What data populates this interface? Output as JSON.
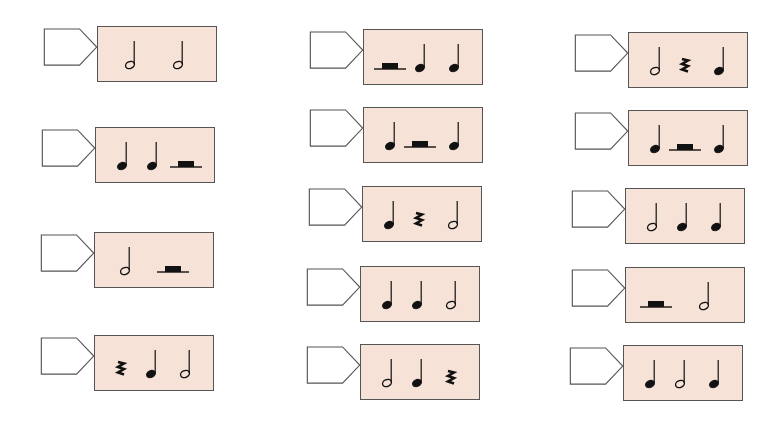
{
  "worksheet": {
    "colors": {
      "box_fill": "#f7e2d8",
      "box_border": "#555555",
      "tag_fill": "#ffffff",
      "tag_border": "#555555",
      "ink": "#111111"
    },
    "legend": {
      "half": "half-note",
      "quarter": "quarter-note",
      "quarter_rest": "quarter-rest",
      "half_rest": "half-rest"
    },
    "columns": [
      {
        "measures": [
          {
            "id": "c1-r1",
            "answer": "",
            "symbols": [
              "half",
              "half"
            ]
          },
          {
            "id": "c1-r2",
            "answer": "",
            "symbols": [
              "quarter",
              "quarter",
              "half_rest"
            ]
          },
          {
            "id": "c1-r3",
            "answer": "",
            "symbols": [
              "half",
              "half_rest"
            ]
          },
          {
            "id": "c1-r4",
            "answer": "",
            "symbols": [
              "quarter_rest",
              "quarter",
              "half"
            ]
          }
        ]
      },
      {
        "measures": [
          {
            "id": "c2-r1",
            "answer": "",
            "symbols": [
              "half_rest",
              "quarter",
              "quarter"
            ]
          },
          {
            "id": "c2-r2",
            "answer": "",
            "symbols": [
              "quarter",
              "half_rest",
              "quarter"
            ]
          },
          {
            "id": "c2-r3",
            "answer": "",
            "symbols": [
              "quarter",
              "quarter_rest",
              "half"
            ]
          },
          {
            "id": "c2-r4",
            "answer": "",
            "symbols": [
              "quarter",
              "quarter",
              "half"
            ]
          },
          {
            "id": "c2-r5",
            "answer": "",
            "symbols": [
              "half",
              "quarter",
              "quarter_rest"
            ]
          }
        ]
      },
      {
        "measures": [
          {
            "id": "c3-r1",
            "answer": "",
            "symbols": [
              "half",
              "quarter_rest",
              "quarter"
            ]
          },
          {
            "id": "c3-r2",
            "answer": "",
            "symbols": [
              "quarter",
              "half_rest",
              "quarter"
            ]
          },
          {
            "id": "c3-r3",
            "answer": "",
            "symbols": [
              "half",
              "quarter",
              "quarter"
            ]
          },
          {
            "id": "c3-r4",
            "answer": "",
            "symbols": [
              "half_rest",
              "half"
            ]
          },
          {
            "id": "c3-r5",
            "answer": "",
            "symbols": [
              "quarter",
              "half",
              "quarter"
            ]
          }
        ]
      }
    ]
  }
}
